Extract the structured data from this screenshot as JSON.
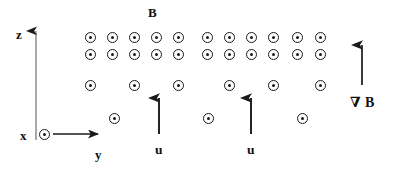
{
  "figure": {
    "title_visible": false,
    "background": "#ffffff",
    "ink_color": "#1a1a1a",
    "width": 397,
    "height": 173
  },
  "labels": {
    "field": "B",
    "axis_z": "z",
    "axis_y": "y",
    "axis_x": "x",
    "velocity_left": "u",
    "velocity_right": "u",
    "gradient": "∇ B"
  },
  "diagram_data": {
    "type": "vector-field-schematic",
    "description": "Magnetic field B out of page (circle-dot symbols) with density decreasing downward, two upward velocity arrows u, a gradient arrow grad-B pointing upward, and an x-y-z coordinate frame.",
    "symbol": "circle-dot",
    "symbol_meaning": "field out of page",
    "field_rows": [
      {
        "row": 1,
        "y": 37,
        "count": 11,
        "x_positions": [
          90,
          112,
          134,
          156,
          178,
          207,
          229,
          251,
          273,
          297,
          320
        ]
      },
      {
        "row": 2,
        "y": 54,
        "count": 11,
        "x_positions": [
          90,
          112,
          134,
          156,
          178,
          207,
          229,
          251,
          273,
          297,
          320
        ]
      },
      {
        "row": 3,
        "y": 85,
        "count": 6,
        "x_positions": [
          90,
          134,
          178,
          229,
          273,
          320
        ]
      },
      {
        "row": 4,
        "y": 118,
        "count": 3,
        "x_positions": [
          114,
          208,
          302
        ]
      }
    ],
    "arrows": [
      {
        "name": "z-axis",
        "label": "z",
        "x1": 36,
        "y1": 136,
        "x2": 36,
        "y2": 24,
        "direction": "up"
      },
      {
        "name": "y-axis",
        "label": "y",
        "x1": 52,
        "y1": 134,
        "x2": 106,
        "y2": 134,
        "direction": "right"
      },
      {
        "name": "velocity-left",
        "label": "u",
        "x1": 159,
        "y1": 134,
        "x2": 159,
        "y2": 90,
        "direction": "up"
      },
      {
        "name": "velocity-right",
        "label": "u",
        "x1": 251,
        "y1": 134,
        "x2": 251,
        "y2": 90,
        "direction": "up"
      },
      {
        "name": "gradient",
        "label": "∇ B",
        "x1": 362,
        "y1": 85,
        "x2": 362,
        "y2": 38,
        "direction": "up"
      }
    ],
    "origin_marker": {
      "name": "x-axis-out-of-page",
      "label": "x",
      "x": 44,
      "y": 134,
      "symbol": "circle-dot"
    },
    "label_positions": {
      "field": {
        "x": 148,
        "y": 12
      },
      "axis_z": {
        "x": 17,
        "y": 33
      },
      "axis_y": {
        "x": 96,
        "y": 155
      },
      "axis_x": {
        "x": 22,
        "y": 134
      },
      "velocity_left": {
        "x": 155,
        "y": 150
      },
      "velocity_right": {
        "x": 247,
        "y": 150
      },
      "gradient": {
        "x": 352,
        "y": 103
      }
    }
  }
}
